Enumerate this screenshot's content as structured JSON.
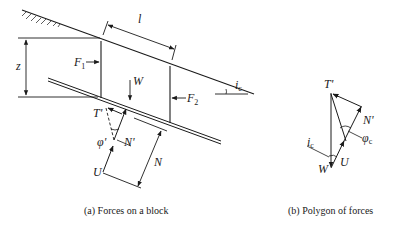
{
  "diagram": {
    "panel_a": {
      "caption": "(a) Forces on a block",
      "labels": {
        "length": "l",
        "depth": "z",
        "force_left": "F",
        "force_left_sub": "1",
        "force_right": "F",
        "force_right_sub": "2",
        "weight": "W",
        "slope_angle": "i",
        "slope_angle_sub": "c",
        "shear": "T'",
        "friction_angle": "φ'",
        "effective_normal": "N'",
        "pore_pressure": "U",
        "normal": "N"
      }
    },
    "panel_b": {
      "caption": "(b) Polygon of forces",
      "labels": {
        "shear": "T'",
        "effective_normal": "N'",
        "friction_angle": "φ",
        "friction_angle_sub": "c",
        "slope_angle": "i",
        "slope_angle_sub": "c",
        "pore_pressure": "U",
        "weight": "W"
      }
    },
    "colors": {
      "ink": "#1a1a1a",
      "background": "#ffffff"
    }
  }
}
